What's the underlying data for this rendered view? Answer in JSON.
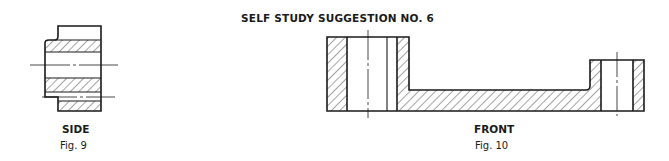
{
  "title": "SELF STUDY SUGGESTION NO. 6",
  "figures": [
    {
      "view_label": "SIDE",
      "caption": "Fig. 9"
    },
    {
      "view_label": "FRONT",
      "caption": "Fig. 10"
    }
  ],
  "colors": {
    "line": "#1a1a1a",
    "background": "#ffffff"
  }
}
